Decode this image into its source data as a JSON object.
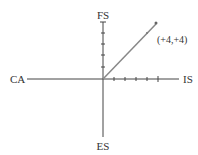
{
  "diagram": {
    "axes": {
      "top": "FS",
      "bottom": "ES",
      "left": "CA",
      "right": "IS"
    },
    "vector_label": "(+4,+4)",
    "vector": {
      "x": 4,
      "y": 4
    },
    "ticks_per_axis": 5,
    "colors": {
      "axis": "#444444",
      "vector": "#888888",
      "text": "#333333"
    }
  }
}
